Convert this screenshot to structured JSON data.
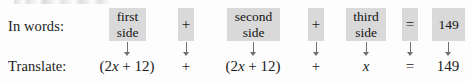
{
  "figure": {
    "background_color": "#fdfdfd",
    "box_fill_color": "#d9d9d9",
    "text_color": "#1c1c1c",
    "arrow_color": "#6f6f6f",
    "rows": {
      "words_label": "In words:",
      "translate_label": "Translate:"
    },
    "terms": [
      {
        "id": "first-side",
        "kind": "phrase",
        "words_line1": "first",
        "words_line2": "side",
        "translation": "(2x + 12)"
      },
      {
        "id": "plus-1",
        "kind": "operator",
        "words_line1": "+",
        "words_line2": "",
        "translation": "+"
      },
      {
        "id": "second-side",
        "kind": "phrase",
        "words_line1": "second",
        "words_line2": "side",
        "translation": "(2x + 12)"
      },
      {
        "id": "plus-2",
        "kind": "operator",
        "words_line1": "+",
        "words_line2": "",
        "translation": "+"
      },
      {
        "id": "third-side",
        "kind": "phrase",
        "words_line1": "third",
        "words_line2": "side",
        "translation": "x"
      },
      {
        "id": "equals",
        "kind": "operator",
        "words_line1": "=",
        "words_line2": "",
        "translation": "="
      },
      {
        "id": "total",
        "kind": "value",
        "words_line1": "149",
        "words_line2": "",
        "translation": "149"
      }
    ]
  }
}
